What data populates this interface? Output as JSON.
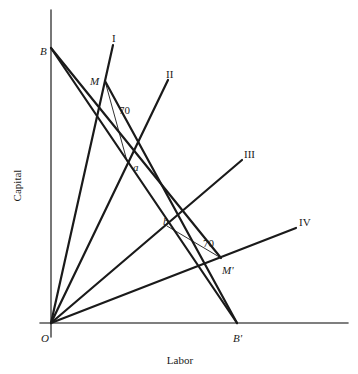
{
  "figure": {
    "width": 358,
    "height": 374,
    "background": "#ffffff",
    "line_color": "#1a1a1a",
    "axis_color": "#555555"
  },
  "axes": {
    "x_label": "Labor",
    "y_label": "Capital",
    "origin_label": "O",
    "x_axis": {
      "x1": 40,
      "y1": 323,
      "x2": 348,
      "y2": 323
    },
    "y_axis": {
      "x1": 51,
      "y1": 10,
      "x2": 51,
      "y2": 337
    },
    "x_label_pos": {
      "x": 180,
      "y": 355
    },
    "y_label_pos": {
      "x": 17,
      "y": 180
    },
    "origin_label_pos": {
      "x": 41,
      "y": 333
    }
  },
  "chart_data": {
    "type": "line",
    "title": "",
    "xlabel": "Labor",
    "ylabel": "Capital",
    "rays": [
      {
        "name": "I",
        "label": "I",
        "from": {
          "x": 51,
          "y": 323
        },
        "to": {
          "x": 113,
          "y": 45
        },
        "label_pos": {
          "x": 112,
          "y": 33
        },
        "width": 2.2
      },
      {
        "name": "II",
        "label": "II",
        "from": {
          "x": 51,
          "y": 323
        },
        "to": {
          "x": 168,
          "y": 80
        },
        "label_pos": {
          "x": 166,
          "y": 69
        },
        "width": 2.2
      },
      {
        "name": "III",
        "label": "III",
        "from": {
          "x": 51,
          "y": 323
        },
        "to": {
          "x": 242,
          "y": 160
        },
        "label_pos": {
          "x": 244,
          "y": 149
        },
        "width": 2.2
      },
      {
        "name": "IV",
        "label": "IV",
        "from": {
          "x": 51,
          "y": 323
        },
        "to": {
          "x": 296,
          "y": 228
        },
        "label_pos": {
          "x": 299,
          "y": 217
        },
        "width": 2.2
      }
    ],
    "budget_line": {
      "label_start": "B",
      "label_end": "B'",
      "from": {
        "x": 51,
        "y": 48
      },
      "to": {
        "x": 237,
        "y": 323
      },
      "label_start_pos": {
        "x": 40,
        "y": 46
      },
      "label_end_pos": {
        "x": 233,
        "y": 333
      },
      "width": 2.2
    },
    "isocost_lines": [
      {
        "name": "B-to-M-prime",
        "from": {
          "x": 51,
          "y": 48
        },
        "to": {
          "x": 221,
          "y": 258
        },
        "width": 2.2
      },
      {
        "name": "M-to-B-prime",
        "from": {
          "x": 105,
          "y": 81
        },
        "to": {
          "x": 237,
          "y": 323
        },
        "width": 2.2
      }
    ],
    "angle_markers": [
      {
        "label": "70",
        "from": {
          "x": 105,
          "y": 81
        },
        "to": {
          "x": 127,
          "y": 161
        },
        "label_pos": {
          "x": 119,
          "y": 105
        },
        "width": 0.9
      },
      {
        "label": "70",
        "from": {
          "x": 167,
          "y": 226
        },
        "to": {
          "x": 221,
          "y": 258
        },
        "label_pos": {
          "x": 203,
          "y": 238
        },
        "width": 0.9
      }
    ],
    "points": [
      {
        "label": "a",
        "x": 126,
        "y": 161,
        "label_pos": {
          "x": 133,
          "y": 162
        },
        "style": "italic"
      },
      {
        "label": "b",
        "x": 167,
        "y": 225,
        "label_pos": {
          "x": 163,
          "y": 216
        },
        "style": "italic"
      },
      {
        "label": "M",
        "x": 105,
        "y": 81,
        "label_pos": {
          "x": 90,
          "y": 76
        },
        "style": "italic"
      },
      {
        "label": "M'",
        "x": 221,
        "y": 258,
        "label_pos": {
          "x": 222,
          "y": 265
        },
        "style": "italic"
      }
    ]
  }
}
